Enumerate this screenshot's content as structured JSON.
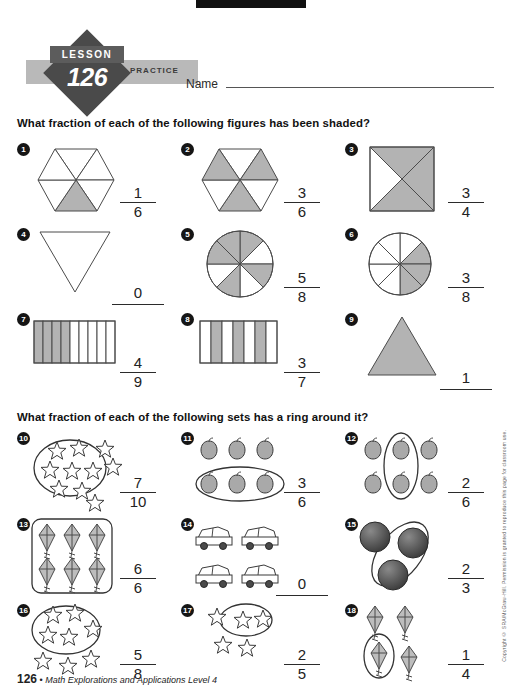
{
  "worksheet": {
    "lesson_label": "LESSON",
    "lesson_number": "126",
    "practice_label": "PRACTICE",
    "name_label": "Name",
    "page_number": "126",
    "footer_text": "Math Explorations and Applications  Level 4",
    "footer_separator": "•",
    "copyright": "Copyright © SRA/McGraw-Hill. Permission is granted to reproduce this page for classroom use."
  },
  "sections": [
    {
      "id": "figures",
      "heading": "What fraction of each of the following figures has been shaded?",
      "problems": [
        {
          "number": "1",
          "figure": "hexagon-6",
          "shaded": 1,
          "total": 6,
          "numerator": "1",
          "denominator": "6",
          "answer": "1/6"
        },
        {
          "number": "2",
          "figure": "hexagon-6-alt",
          "shaded": 3,
          "total": 6,
          "numerator": "3",
          "denominator": "6",
          "answer": "3/6"
        },
        {
          "number": "3",
          "figure": "square-x-4",
          "shaded": 3,
          "total": 4,
          "numerator": "3",
          "denominator": "4",
          "answer": "3/4"
        },
        {
          "number": "4",
          "figure": "triangle-down",
          "shaded": 0,
          "total": 1,
          "whole": "0",
          "answer": "0"
        },
        {
          "number": "5",
          "figure": "circle-8",
          "shaded": 5,
          "total": 8,
          "numerator": "5",
          "denominator": "8",
          "answer": "5/8"
        },
        {
          "number": "6",
          "figure": "circle-8-right",
          "shaded": 3,
          "total": 8,
          "numerator": "3",
          "denominator": "8",
          "answer": "3/8"
        },
        {
          "number": "7",
          "figure": "bar-9",
          "shaded": 4,
          "total": 9,
          "numerator": "4",
          "denominator": "9",
          "answer": "4/9"
        },
        {
          "number": "8",
          "figure": "bar-7-alt",
          "shaded": 3,
          "total": 7,
          "numerator": "3",
          "denominator": "7",
          "answer": "3/7"
        },
        {
          "number": "9",
          "figure": "triangle-up-filled",
          "shaded": 1,
          "total": 1,
          "whole": "1",
          "answer": "1"
        }
      ]
    },
    {
      "id": "sets",
      "heading": "What fraction of each of the following sets has a ring around it?",
      "problems": [
        {
          "number": "10",
          "figure": "stars-10-ring7",
          "object": "star",
          "count": 10,
          "ringed": 7,
          "numerator": "7",
          "denominator": "10",
          "answer": "7/10"
        },
        {
          "number": "11",
          "figure": "apples-6-ring-row",
          "object": "apple",
          "count": 6,
          "ringed": 3,
          "numerator": "3",
          "denominator": "6",
          "answer": "3/6"
        },
        {
          "number": "12",
          "figure": "apples-6-ring-col",
          "object": "apple",
          "count": 6,
          "ringed": 2,
          "numerator": "2",
          "denominator": "6",
          "answer": "2/6"
        },
        {
          "number": "13",
          "figure": "kites-6-ring-all",
          "object": "kite",
          "count": 6,
          "ringed": 6,
          "numerator": "6",
          "denominator": "6",
          "answer": "6/6"
        },
        {
          "number": "14",
          "figure": "cars-4-no-ring",
          "object": "car",
          "count": 4,
          "ringed": 0,
          "whole": "0",
          "answer": "0"
        },
        {
          "number": "15",
          "figure": "balls-3-ring2",
          "object": "ball",
          "count": 3,
          "ringed": 2,
          "numerator": "2",
          "denominator": "3",
          "answer": "2/3"
        },
        {
          "number": "16",
          "figure": "stars-8-ring5",
          "object": "star",
          "count": 8,
          "ringed": 5,
          "numerator": "5",
          "denominator": "8",
          "answer": "5/8"
        },
        {
          "number": "17",
          "figure": "stars-5-ring2",
          "object": "star",
          "count": 5,
          "ringed": 2,
          "numerator": "2",
          "denominator": "5",
          "answer": "2/5"
        },
        {
          "number": "18",
          "figure": "kites-4-ring1",
          "object": "kite",
          "count": 4,
          "ringed": 1,
          "numerator": "1",
          "denominator": "4",
          "answer": "1/4"
        }
      ]
    }
  ],
  "colors": {
    "shade_gray": "#b3b3b3",
    "line": "#4b4b4b",
    "badge_dark": "#4a4a4a",
    "badge_band": "#b9b9b9"
  }
}
